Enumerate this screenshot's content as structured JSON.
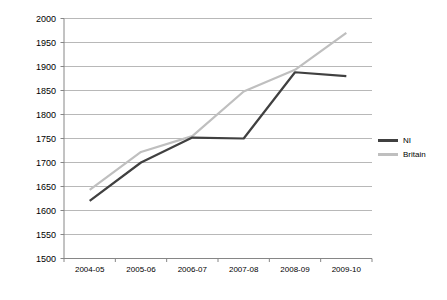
{
  "chart_data": {
    "type": "line",
    "title": "",
    "xlabel": "",
    "ylabel": "",
    "categories": [
      "2004-05",
      "2005-06",
      "2006-07",
      "2007-08",
      "2008-09",
      "2009-10"
    ],
    "ylim": [
      1500,
      2000
    ],
    "ytick_step": 50,
    "yticks": [
      2000,
      1950,
      1900,
      1850,
      1800,
      1750,
      1700,
      1650,
      1600,
      1550,
      1500
    ],
    "grid": true,
    "legend_position": "right",
    "series": [
      {
        "name": "NI",
        "color": "#404040",
        "values": [
          1620,
          1700,
          1752,
          1750,
          1888,
          1880
        ]
      },
      {
        "name": "Britain",
        "color": "#bfbfbf",
        "values": [
          1643,
          1722,
          1755,
          1848,
          1893,
          1970
        ]
      }
    ]
  },
  "axis": {
    "yticks": [
      "2000",
      "1950",
      "1900",
      "1850",
      "1800",
      "1750",
      "1700",
      "1650",
      "1600",
      "1550",
      "1500"
    ],
    "xticks": [
      "2004-05",
      "2005-06",
      "2006-07",
      "2007-08",
      "2008-09",
      "2009-10"
    ]
  },
  "legend": {
    "items": [
      {
        "label": "NI",
        "color": "#404040"
      },
      {
        "label": "Britain",
        "color": "#bfbfbf"
      }
    ]
  },
  "style": {
    "grid_color": "#a6a6a6",
    "axis_color": "#868686",
    "text_color": "#000000",
    "background": "#ffffff"
  }
}
